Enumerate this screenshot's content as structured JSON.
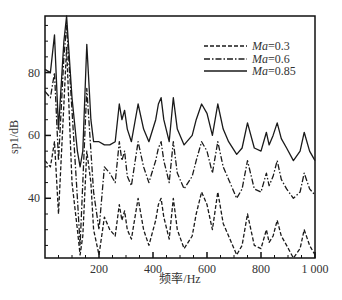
{
  "chart_data": {
    "type": "line",
    "title": "",
    "xlabel": "频率/Hz",
    "ylabel": "sp1/dB",
    "xlim": [
      0,
      1000
    ],
    "ylim": [
      21,
      98
    ],
    "x_ticks": [
      200,
      400,
      600,
      800,
      1000
    ],
    "x_tick_labels": [
      "200",
      "400",
      "600",
      "800",
      "1 000"
    ],
    "y_ticks": [
      40,
      60,
      80
    ],
    "y_tick_labels": [
      "40",
      "60",
      "80"
    ],
    "grid": false,
    "legend_position": "upper right",
    "x": [
      0,
      20,
      35,
      50,
      70,
      80,
      100,
      120,
      130,
      140,
      155,
      170,
      180,
      200,
      220,
      240,
      260,
      275,
      285,
      295,
      305,
      320,
      345,
      365,
      385,
      410,
      420,
      430,
      440,
      460,
      475,
      490,
      515,
      545,
      560,
      580,
      600,
      620,
      640,
      660,
      680,
      710,
      730,
      750,
      775,
      800,
      820,
      830,
      845,
      860,
      875,
      895,
      920,
      945,
      960,
      980,
      1000
    ],
    "series": [
      {
        "name": "Ma=0.3",
        "style": "dashed",
        "values": [
          52,
          50,
          58,
          35,
          70,
          88,
          45,
          30,
          22,
          28,
          55,
          45,
          30,
          22,
          34,
          30,
          28,
          38,
          33,
          36,
          30,
          27,
          40,
          30,
          25,
          33,
          38,
          40,
          34,
          27,
          40,
          30,
          24,
          28,
          35,
          42,
          38,
          30,
          42,
          32,
          28,
          22,
          25,
          35,
          25,
          24,
          30,
          26,
          28,
          33,
          28,
          25,
          21,
          24,
          30,
          25,
          22
        ]
      },
      {
        "name": "Ma=0.6",
        "style": "dash-dot",
        "values": [
          74,
          72,
          80,
          52,
          85,
          95,
          68,
          40,
          25,
          45,
          75,
          55,
          42,
          30,
          50,
          48,
          45,
          58,
          52,
          55,
          47,
          44,
          58,
          50,
          45,
          52,
          56,
          58,
          52,
          45,
          58,
          48,
          43,
          47,
          52,
          58,
          55,
          48,
          58,
          50,
          46,
          40,
          43,
          52,
          43,
          42,
          48,
          44,
          47,
          52,
          46,
          43,
          40,
          42,
          48,
          43,
          41
        ]
      },
      {
        "name": "Ma=0.85",
        "style": "solid",
        "values": [
          81,
          80,
          92,
          62,
          90,
          98,
          72,
          55,
          50,
          55,
          89,
          65,
          58,
          58,
          57,
          57,
          58,
          70,
          65,
          68,
          62,
          58,
          70,
          62,
          58,
          65,
          70,
          72,
          65,
          58,
          72,
          62,
          57,
          60,
          65,
          70,
          67,
          60,
          70,
          62,
          58,
          54,
          56,
          64,
          56,
          55,
          61,
          57,
          60,
          64,
          59,
          56,
          52,
          55,
          61,
          55,
          52
        ]
      }
    ]
  },
  "axes": {
    "xlabel": "频率/Hz",
    "ylabel": "sp1/dB"
  },
  "legend": [
    {
      "prefix": "Ma",
      "suffix": "=0.3",
      "style": "dashed"
    },
    {
      "prefix": "Ma",
      "suffix": "=0.6",
      "style": "dash-dot"
    },
    {
      "prefix": "Ma",
      "suffix": "=0.85",
      "style": "solid"
    }
  ],
  "colors": {
    "line": "#1a1a1a",
    "axis": "#111111",
    "text": "#333333"
  }
}
